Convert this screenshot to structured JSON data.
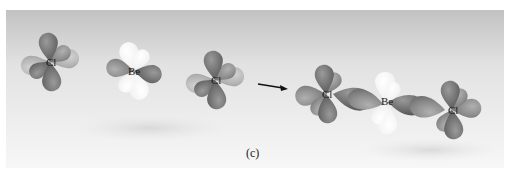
{
  "figure": {
    "caption": "(c)"
  },
  "reactants": {
    "atoms": [
      {
        "label": "Cl"
      },
      {
        "label": "Be"
      },
      {
        "label": "Cl"
      }
    ]
  },
  "product": {
    "atoms": [
      {
        "label": "Cl"
      },
      {
        "label": "Be"
      },
      {
        "label": "Cl"
      }
    ]
  },
  "arrow": {
    "direction": "right"
  },
  "colors": {
    "panel_top": "#c4c4c4",
    "panel_bottom": "#f6f6f6",
    "lobe_dark": "#6e6e6e",
    "lobe_mid": "#8c8c8c",
    "lobe_light": "#b4b4b4",
    "lobe_white": "#f4f4f4"
  }
}
